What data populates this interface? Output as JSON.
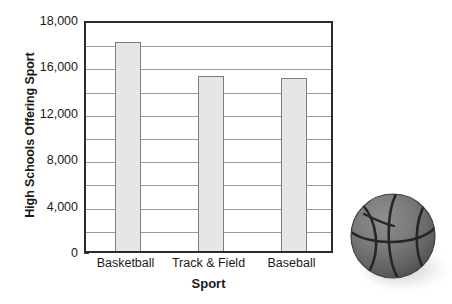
{
  "chart_data": {
    "type": "bar",
    "title": "",
    "xlabel": "Sport",
    "ylabel": "High Schools Offering Sport",
    "categories": [
      "Basketball",
      "Track & Field",
      "Baseball"
    ],
    "values": [
      17000,
      15100,
      14900
    ],
    "ylim": [
      0,
      18000
    ],
    "ytick_labels": [
      "0",
      "4,000",
      "8,000",
      "12,000",
      "16,000",
      "18,000"
    ],
    "ytick_values": [
      0,
      4000,
      8000,
      12000,
      16000,
      18000
    ],
    "gridlines": [
      2000,
      4000,
      6000,
      8000,
      10000,
      12000,
      14000,
      16000,
      17000
    ],
    "grid": true,
    "legend": "none",
    "bar_fill_color": "#e6e6e6",
    "bar_edge_color": "#7d7d7d",
    "axis_color": "#2b2b2b",
    "gridline_color": "#9a9a9a"
  },
  "decoration": {
    "basketball_label": "basketball-photo"
  }
}
